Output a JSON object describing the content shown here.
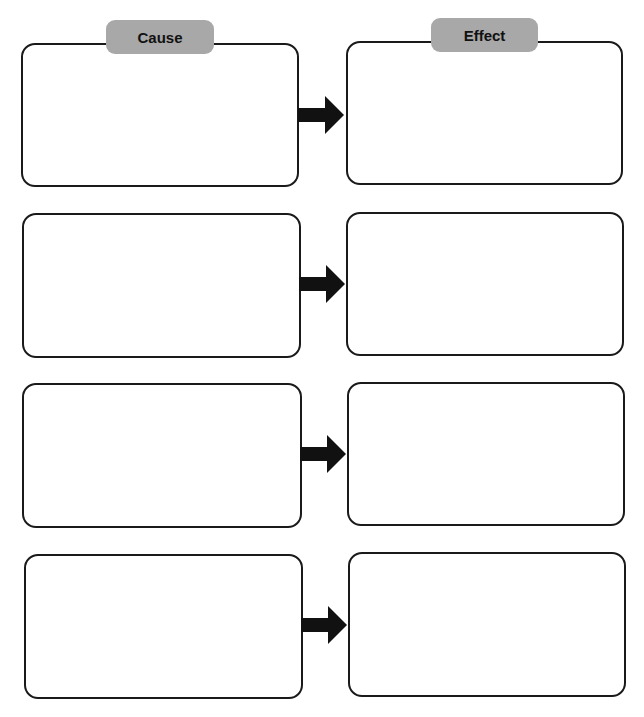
{
  "diagram": {
    "type": "cause-effect graphic organizer",
    "headers": {
      "cause": "Cause",
      "effect": "Effect"
    },
    "tab_color": "#a8a8a8",
    "border_color": "#1a1a1a",
    "rows": [
      {
        "cause": "",
        "effect": ""
      },
      {
        "cause": "",
        "effect": ""
      },
      {
        "cause": "",
        "effect": ""
      },
      {
        "cause": "",
        "effect": ""
      }
    ]
  }
}
